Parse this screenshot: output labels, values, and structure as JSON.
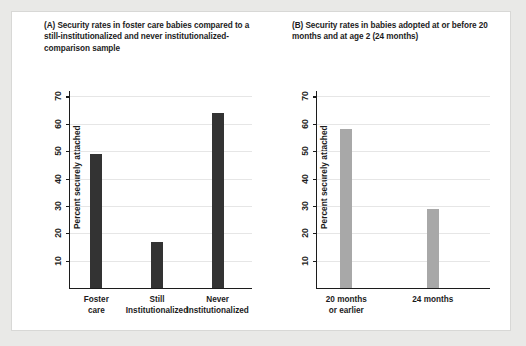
{
  "figure": {
    "background_color": "#e9e9e7",
    "panel_background": "#ffffff"
  },
  "chart_data": [
    {
      "type": "bar",
      "panel": "A",
      "title": "(A) Security rates in foster care babies compared to a still-institutionalized and never institutionalized-comparison sample",
      "categories": [
        "Foster\ncare",
        "Still\nInstitutionalized",
        "Never\nInstitutionalized"
      ],
      "values": [
        49,
        17,
        64
      ],
      "xlabel": "",
      "ylabel": "Percent securely attached",
      "ylim": [
        0,
        72
      ],
      "yticks": [
        10,
        20,
        30,
        40,
        50,
        60,
        70
      ],
      "ytick_labels": [
        "10",
        "20",
        "30",
        "40",
        "50",
        "60",
        "70"
      ],
      "grid": true,
      "legend": "none",
      "bar_color": "#333333"
    },
    {
      "type": "bar",
      "panel": "B",
      "title": "(B) Security rates in babies adopted at or before 20 months and at age 2 (24 months)",
      "categories": [
        "20 months\nor earlier",
        "24 months"
      ],
      "values": [
        58,
        29
      ],
      "xlabel": "",
      "ylabel": "Percent securely attached",
      "ylim": [
        0,
        72
      ],
      "yticks": [
        10,
        20,
        30,
        40,
        50,
        60,
        70
      ],
      "ytick_labels": [
        "10",
        "20",
        "30",
        "40",
        "50",
        "60",
        "70"
      ],
      "grid": true,
      "legend": "none",
      "bar_color": "#a8a8a8"
    }
  ]
}
